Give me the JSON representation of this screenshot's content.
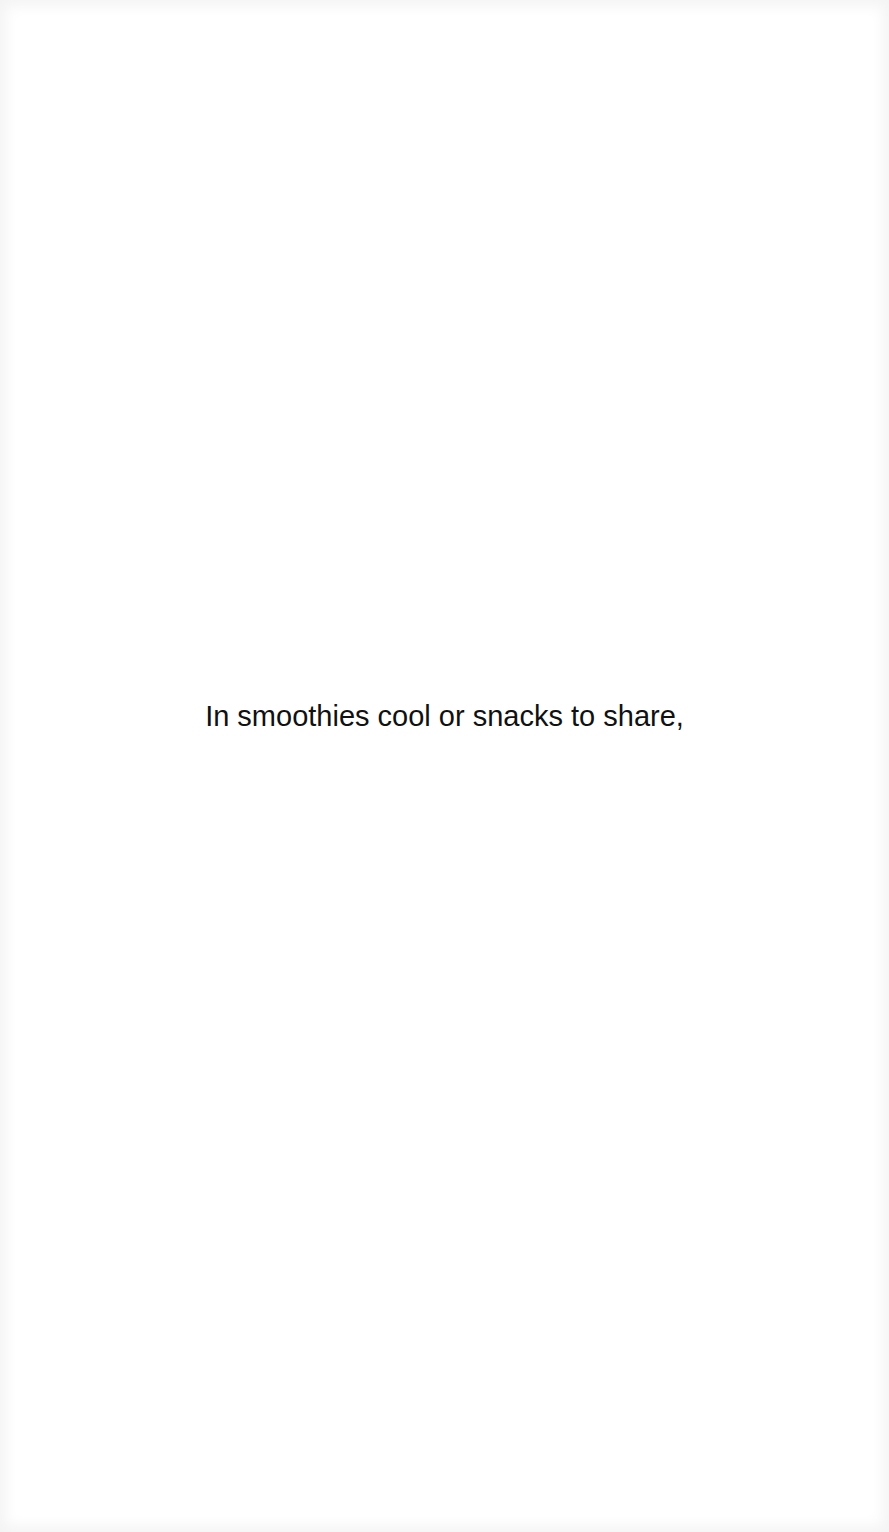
{
  "document": {
    "lines": [
      "In smoothies cool or snacks to share,"
    ]
  }
}
